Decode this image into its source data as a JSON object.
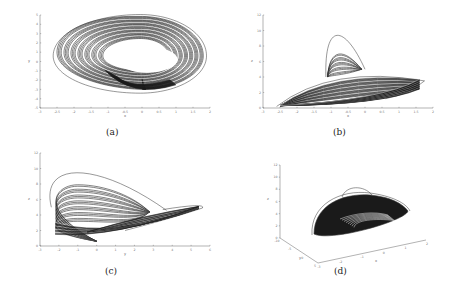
{
  "chart_data": [
    {
      "id": "a",
      "type": "line",
      "title": "",
      "caption": "(a)",
      "xlabel": "x",
      "ylabel": "y",
      "xlim": [
        -3,
        2
      ],
      "ylim": [
        -5,
        5
      ],
      "xticks": [
        "-3",
        "-2.5",
        "-2",
        "-1.5",
        "-1",
        "-0.5",
        "0",
        "0.5",
        "1",
        "1.5",
        "2"
      ],
      "yticks": [
        "-5",
        "-4",
        "-3",
        "-2",
        "-1",
        "0",
        "1",
        "2",
        "3",
        "4",
        "5"
      ],
      "grid": false,
      "series": [
        {
          "name": "trajectory",
          "shape": "ring-attractor",
          "center": [
            -0.1,
            0.5
          ],
          "outer_radius": [
            1.95,
            4.3
          ],
          "inner_radius": [
            0.75,
            1.7
          ],
          "left_tip": [
            -2.5,
            0.0
          ],
          "bottom": [
            0.0,
            -4.3
          ]
        }
      ]
    },
    {
      "id": "b",
      "type": "line",
      "title": "",
      "caption": "(b)",
      "xlabel": "x",
      "ylabel": "z",
      "xlim": [
        -3,
        2
      ],
      "ylim": [
        0,
        12
      ],
      "xticks": [
        "-3",
        "-2.5",
        "-2",
        "-1.5",
        "-1",
        "-0.5",
        "0",
        "0.5",
        "1",
        "1.5",
        "2"
      ],
      "yticks": [
        "0",
        "2",
        "4",
        "6",
        "8",
        "10",
        "12"
      ],
      "grid": false,
      "series": [
        {
          "name": "trajectory",
          "shape": "fin-attractor",
          "base_left": [
            -2.5,
            0.3
          ],
          "base_right": [
            1.6,
            3.6
          ],
          "peak": [
            -0.9,
            10.3
          ],
          "lobe_top": [
            -0.9,
            7.8
          ]
        }
      ]
    },
    {
      "id": "c",
      "type": "line",
      "title": "",
      "caption": "(c)",
      "xlabel": "y",
      "ylabel": "z",
      "xlim": [
        -3,
        6
      ],
      "ylim": [
        0,
        12
      ],
      "xticks": [
        "-3",
        "-2",
        "-1",
        "0",
        "1",
        "2",
        "3",
        "4",
        "5",
        "6"
      ],
      "yticks": [
        "0",
        "2",
        "4",
        "6",
        "8",
        "10",
        "12"
      ],
      "grid": false,
      "series": [
        {
          "name": "trajectory",
          "shape": "wing-attractor",
          "left": [
            -2.6,
            5.0
          ],
          "top": [
            -1.0,
            10.3
          ],
          "right_tip": [
            5.5,
            5.2
          ],
          "bottom": [
            0.0,
            0.3
          ]
        }
      ]
    },
    {
      "id": "d",
      "type": "line",
      "title": "",
      "caption": "(d)",
      "xlabel": "x",
      "ylabel": "y",
      "zlabel": "z",
      "projection": "3d",
      "xlim": [
        -3,
        2
      ],
      "ylim": [
        -10,
        5
      ],
      "zlim": [
        0,
        12
      ],
      "xticks": [
        "-3",
        "-2",
        "-1",
        "0",
        "1",
        "2"
      ],
      "yticks": [
        "-10",
        "-5",
        "0",
        "5"
      ],
      "zticks": [
        "0",
        "2",
        "4",
        "6",
        "8",
        "10",
        "12"
      ],
      "grid": false,
      "series": [
        {
          "name": "trajectory",
          "shape": "dome-attractor"
        }
      ]
    }
  ]
}
